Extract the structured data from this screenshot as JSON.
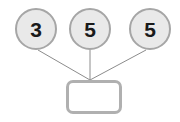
{
  "diagram": {
    "type": "number-bond",
    "background_color": "#ffffff",
    "connector_color": "#8c8c8c",
    "part_fill_color": "#e9e9e9",
    "part_border_color": "#a6a6a6",
    "whole_fill_color": "#ffffff",
    "whole_border_color": "#b0b0b0",
    "text_color": "#1a1a1a",
    "parts": [
      {
        "value": "3",
        "cx": 36,
        "cy": 29,
        "r": 21
      },
      {
        "value": "5",
        "cx": 90,
        "cy": 29,
        "r": 21
      },
      {
        "value": "5",
        "cx": 150,
        "cy": 29,
        "r": 21
      }
    ],
    "whole": {
      "value": "",
      "x": 66,
      "y": 80,
      "width": 56,
      "height": 34
    },
    "connectors": [
      {
        "from": "part-0",
        "to": "whole",
        "x1": 38,
        "y1": 50,
        "x2": 90,
        "y2": 80
      },
      {
        "from": "part-1",
        "to": "whole",
        "x1": 90,
        "y1": 50,
        "x2": 90,
        "y2": 80
      },
      {
        "from": "part-2",
        "to": "whole",
        "x1": 146,
        "y1": 50,
        "x2": 90,
        "y2": 80
      }
    ]
  }
}
